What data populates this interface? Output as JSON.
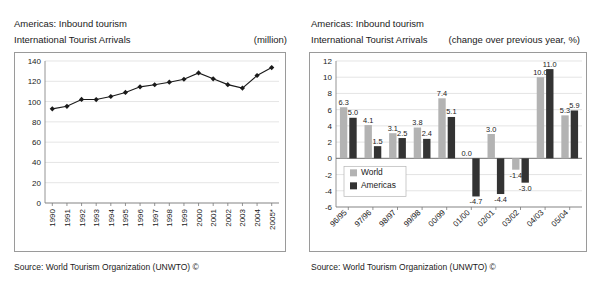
{
  "left_panel": {
    "title": "Americas: Inbound tourism",
    "subtitle": "International Tourist Arrivals",
    "unit": "(million)",
    "source": "Source: World Tourism Organization (UNWTO) ©"
  },
  "right_panel": {
    "title": "Americas: Inbound tourism",
    "subtitle": "International Tourist Arrivals",
    "unit": "(change over previous year, %)",
    "source": "Source: World Tourism Organization (UNWTO) ©"
  },
  "colors": {
    "world_bar": "#b3b3b3",
    "americas_bar": "#333333",
    "line": "#1a1a1a",
    "grid": "#d8d8d8",
    "axis": "#7a7a7a",
    "panel_border": "#9a9a9a",
    "text": "#1a1a1a"
  },
  "chart_data": [
    {
      "type": "line",
      "title": "Americas: Inbound tourism",
      "subtitle": "International Tourist Arrivals",
      "unit_label": "(million)",
      "xlabel": "",
      "ylabel": "",
      "ylim": [
        0,
        140
      ],
      "yticks": [
        0,
        20,
        40,
        60,
        80,
        100,
        120,
        140
      ],
      "grid": true,
      "legend": "none",
      "marker": "diamond",
      "categories": [
        "1990",
        "1991",
        "1992",
        "1993",
        "1994",
        "1995",
        "1996",
        "1997",
        "1998",
        "1999",
        "2000",
        "2001",
        "2002",
        "2003",
        "2004",
        "2005*"
      ],
      "values": [
        92.8,
        95.3,
        102.1,
        102.0,
        105.0,
        109.0,
        114.5,
        116.6,
        119.1,
        122.0,
        128.2,
        122.4,
        116.7,
        113.3,
        125.7,
        133.5
      ]
    },
    {
      "type": "bar",
      "title": "Americas: Inbound tourism",
      "subtitle": "International Tourist Arrivals",
      "unit_label": "(change over previous year, %)",
      "xlabel": "",
      "ylabel": "",
      "ylim": [
        -6,
        12
      ],
      "yticks": [
        -6,
        -4,
        -2,
        0,
        2,
        4,
        6,
        8,
        10,
        12
      ],
      "grid": true,
      "legend": "inside-left",
      "categories": [
        "96/95",
        "97/96",
        "98/97",
        "99/98",
        "00/99",
        "01/00",
        "02/01",
        "03/02",
        "04/03",
        "05/04"
      ],
      "series": [
        {
          "name": "World",
          "values": [
            6.3,
            4.1,
            3.1,
            3.8,
            7.4,
            0.0,
            3.0,
            -1.4,
            10.0,
            5.3
          ]
        },
        {
          "name": "Americas",
          "values": [
            5.0,
            1.5,
            2.5,
            2.4,
            5.1,
            -4.7,
            -4.4,
            -3.0,
            11.0,
            5.9
          ]
        }
      ],
      "data_labels": {
        "World": [
          "6.3",
          "4.1",
          "3.1",
          "3.8",
          "7.4",
          "0.0",
          "3.0",
          "-1.4",
          "10.0",
          "5.3"
        ],
        "Americas": [
          "5.0",
          "1.5",
          "2.5",
          "2.4",
          "5.1",
          "-4.7",
          "-4.4",
          "-3.0",
          "11.0",
          "5.9"
        ]
      }
    }
  ]
}
